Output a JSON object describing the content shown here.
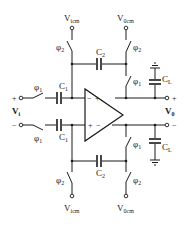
{
  "diagram": {
    "labels": {
      "vicm_top": {
        "main": "V",
        "sub": "icm"
      },
      "vocm_top": {
        "main": "V",
        "sub": "0cm"
      },
      "vicm_bottom": {
        "main": "V",
        "sub": "icm"
      },
      "vocm_bottom": {
        "main": "V",
        "sub": "0cm"
      },
      "phi2_tl": {
        "main": "φ",
        "sub": "2"
      },
      "phi2_tr": {
        "main": "φ",
        "sub": "2"
      },
      "phi1_tr": {
        "main": "φ",
        "sub": "1"
      },
      "phi1_in_top": {
        "main": "φ",
        "sub": "1"
      },
      "phi1_in_bot": {
        "main": "φ",
        "sub": "1"
      },
      "phi1_br": {
        "main": "φ",
        "sub": "1"
      },
      "phi2_bl": {
        "main": "φ",
        "sub": "2"
      },
      "phi2_br": {
        "main": "φ",
        "sub": "2"
      },
      "c1_top": {
        "main": "C",
        "sub": "1"
      },
      "c1_bot": {
        "main": "C",
        "sub": "1"
      },
      "c2_top": {
        "main": "C",
        "sub": "2"
      },
      "c2_bot": {
        "main": "C",
        "sub": "2"
      },
      "cl_top": {
        "main": "C",
        "sub": "L"
      },
      "cl_bot": {
        "main": "C",
        "sub": "L"
      },
      "vi": {
        "main": "V",
        "sub": "i"
      },
      "vo": {
        "main": "V",
        "sub": "0"
      }
    },
    "signs": {
      "in_plus": "+",
      "in_minus": "−",
      "out_plus": "+",
      "out_minus": "−",
      "opamp_in_minus": "−",
      "opamp_in_plus": "+",
      "opamp_out_plus": "+",
      "opamp_out_minus": "−"
    }
  }
}
